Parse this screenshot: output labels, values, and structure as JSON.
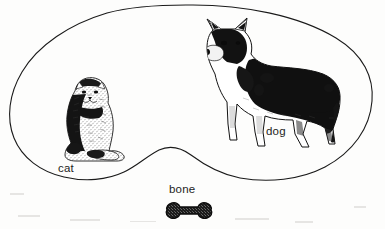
{
  "diagram": {
    "background_color": "#fdfdfc",
    "outline_color": "#1a1a1a",
    "ink_color": "#111111",
    "region": {
      "name": "bean-set-boundary",
      "shape": "kidney",
      "stroke_width": 1.1
    },
    "items": [
      {
        "id": "cat",
        "label": "cat",
        "icon": "cat-illustration",
        "inside_region": true,
        "x": 54,
        "y": 73,
        "width": 74,
        "height": 92
      },
      {
        "id": "dog",
        "label": "dog",
        "icon": "dog-illustration",
        "inside_region": true,
        "x": 183,
        "y": 16,
        "width": 165,
        "height": 144
      },
      {
        "id": "bone",
        "label": "bone",
        "icon": "bone-illustration",
        "inside_region": false,
        "x": 163,
        "y": 200,
        "width": 52,
        "height": 22
      }
    ]
  }
}
